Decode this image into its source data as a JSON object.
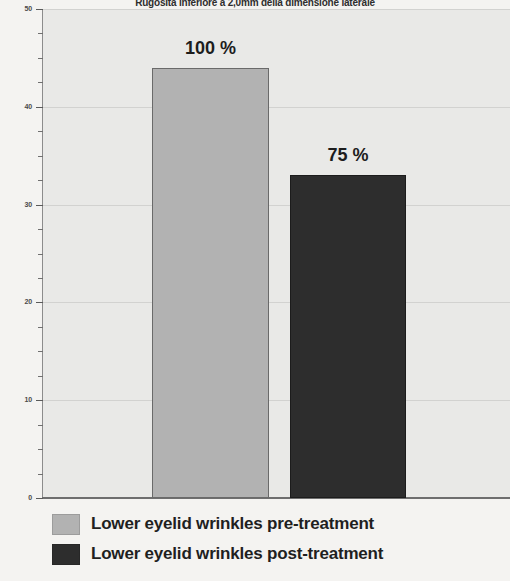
{
  "chart_data": {
    "type": "bar",
    "title": "Rugosità inferiore a 2,0mm della dimensione laterale",
    "xlabel": "",
    "ylabel": "",
    "ylim": [
      0,
      50
    ],
    "yticks": [
      0,
      10,
      20,
      30,
      40,
      50
    ],
    "ytick_labels": [
      "0",
      "10",
      "20",
      "30",
      "40",
      "50"
    ],
    "minor_tick_step": 2.5,
    "grid": true,
    "grid_axis": "y",
    "legend_position": "bottom-left",
    "categories": [
      "Lower eyelid wrinkles pre-treatment",
      "Lower eyelid wrinkles post-treatment"
    ],
    "values": [
      44,
      33
    ],
    "data_labels": [
      "100 %",
      "75 %"
    ],
    "series": [
      {
        "name": "Lower eyelid wrinkles pre-treatment",
        "value": 44,
        "data_label": "100 %",
        "color": "#b2b2b2"
      },
      {
        "name": "Lower eyelid wrinkles post-treatment",
        "value": 33,
        "data_label": "75 %",
        "color": "#2d2d2d"
      }
    ],
    "colors": {
      "plot_background": "#e9e9e7",
      "page_background": "#f4f3f1",
      "gridline": "#d2d2d0",
      "axis": "#6e6e6e",
      "bar_pre": "#b2b2b2",
      "bar_post": "#2d2d2d",
      "text": "#1f1f1f"
    }
  },
  "legend": {
    "items": [
      {
        "label": "Lower eyelid wrinkles pre-treatment",
        "swatch": "pre"
      },
      {
        "label": "Lower eyelid wrinkles post-treatment",
        "swatch": "post"
      }
    ]
  },
  "axis": {
    "y_labels": [
      "50",
      "40",
      "30",
      "20",
      "10",
      "0"
    ]
  }
}
